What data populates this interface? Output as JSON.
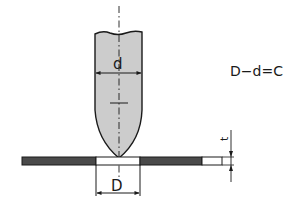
{
  "diagram": {
    "type": "punch-and-die clearance diagram",
    "labels": {
      "punch_diameter": "d",
      "hole_diameter": "D",
      "thickness": "t",
      "formula": "D−d=C"
    },
    "colors": {
      "punch_fill": "#cccccc",
      "sheet_fill": "#4a4a4a",
      "line": "#1a1a1a",
      "background": "#ffffff"
    }
  }
}
